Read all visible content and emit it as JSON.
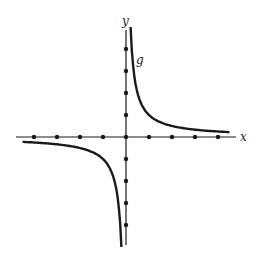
{
  "figure": {
    "type": "reciprocal-function-graph",
    "x_axis_label": "x",
    "y_axis_label": "y",
    "curve_label": "g",
    "colors": {
      "ink": "#1a1a1a",
      "background": "#ffffff"
    }
  },
  "chart_data": {
    "type": "line",
    "title": "",
    "xlabel": "x",
    "ylabel": "y",
    "function": "g(x) = 1/x",
    "series": [
      {
        "name": "g",
        "branch": "positive",
        "x": [
          0.2,
          0.25,
          0.33,
          0.5,
          1,
          2,
          3,
          4,
          4.5
        ],
        "y": [
          5,
          4,
          3,
          2,
          1,
          0.5,
          0.33,
          0.25,
          0.22
        ]
      },
      {
        "name": "g",
        "branch": "negative",
        "x": [
          -4.5,
          -4,
          -3,
          -2,
          -1,
          -0.5,
          -0.33,
          -0.25,
          -0.2
        ],
        "y": [
          -0.22,
          -0.25,
          -0.33,
          -0.5,
          -1,
          -2,
          -3,
          -4,
          -5
        ]
      }
    ],
    "x_tick_marks": [
      -4,
      -3,
      -2,
      -1,
      0,
      1,
      2,
      3,
      4
    ],
    "y_tick_marks": [
      -4,
      -3,
      -2,
      -1,
      0,
      1,
      2,
      3,
      4
    ],
    "tick_labels_shown": false,
    "grid": false,
    "legend": "none"
  }
}
